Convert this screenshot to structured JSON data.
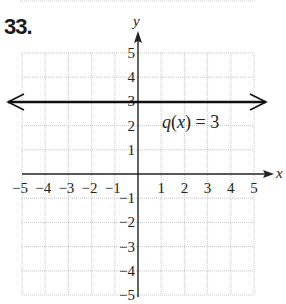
{
  "problem": {
    "number": "33."
  },
  "previous_fragment": {
    "text": "−5."
  },
  "chart_data": {
    "type": "line",
    "title": "",
    "xlabel": "x",
    "ylabel": "y",
    "xlim": [
      -5,
      5
    ],
    "ylim": [
      -5,
      5
    ],
    "grid": true,
    "grid_style": "dotted",
    "x_ticks": [
      -5,
      -4,
      -3,
      -2,
      -1,
      1,
      2,
      3,
      4,
      5
    ],
    "x_tick_labels": [
      "−5",
      "−4",
      "−3",
      "−2",
      "−1",
      "1",
      "2",
      "3",
      "4",
      "5"
    ],
    "y_ticks": [
      5,
      4,
      3,
      2,
      1,
      -1,
      -2,
      -3,
      -4,
      -5
    ],
    "y_tick_labels": [
      "5",
      "4",
      "3",
      "2",
      "1",
      "−1",
      "−2",
      "−3",
      "−4",
      "−5"
    ],
    "series": [
      {
        "name": "q(x) = 3",
        "kind": "horizontal-line",
        "x": [
          -5,
          5
        ],
        "y": [
          3,
          3
        ],
        "arrows": "both",
        "color": "#111111"
      }
    ],
    "annotations": [
      {
        "text": "q(x) = 3",
        "x": 2.2,
        "y": 2.4
      }
    ]
  },
  "labels": {
    "x_axis": "x",
    "y_axis": "y",
    "function_label": "q(x) = 3",
    "xticks": [
      "−5",
      "−4",
      "−3",
      "−2",
      "−1",
      "1",
      "2",
      "3",
      "4",
      "5"
    ],
    "yticks": [
      "5",
      "4",
      "3",
      "2",
      "1",
      "−1",
      "−2",
      "−3",
      "−4",
      "−5"
    ]
  },
  "colors": {
    "axis": "#222222",
    "grid": "#b8b8b8",
    "line": "#111111"
  }
}
